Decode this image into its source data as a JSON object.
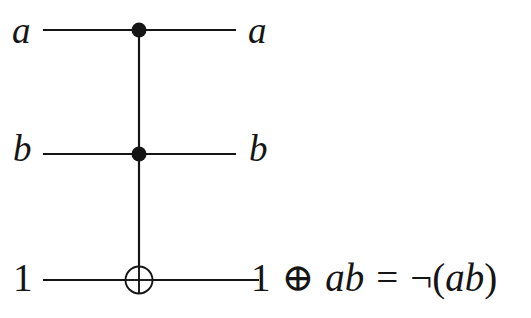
{
  "figure": {
    "type": "quantum-circuit-diagram",
    "background_color": "#ffffff",
    "line_color": "#151515"
  },
  "wires": [
    {
      "id": "wire-a",
      "input_label": "a",
      "output_label": "a",
      "y": 30,
      "x_start": 43,
      "x_end": 236,
      "element": "control-dot",
      "element_x": 139
    },
    {
      "id": "wire-b",
      "input_label": "b",
      "output_label": "b",
      "y": 154,
      "x_start": 43,
      "x_end": 236,
      "element": "control-dot",
      "element_x": 139
    },
    {
      "id": "wire-target",
      "input_label": "1",
      "output_label": "1 ⊕ ab = ¬(ab)",
      "y": 280,
      "x_start": 43,
      "x_end": 259,
      "element": "xor-target",
      "element_x": 139
    }
  ],
  "vertical_link": {
    "x": 139,
    "y_top": 30,
    "y_bottom": 280
  },
  "gates": {
    "control_dot_radius": 7,
    "target_circle_radius": 13.5,
    "stroke_width": 2.2
  },
  "output_expression": {
    "full": "1 ⊕ ab = ¬(ab)",
    "tokens": [
      {
        "text": "1",
        "style": "roman"
      },
      {
        "text": "⊕",
        "style": "operator"
      },
      {
        "text": "ab",
        "style": "italic"
      },
      {
        "text": "=",
        "style": "operator"
      },
      {
        "text": "¬",
        "style": "operator"
      },
      {
        "text": "(",
        "style": "roman"
      },
      {
        "text": "ab",
        "style": "italic"
      },
      {
        "text": ")",
        "style": "roman"
      }
    ]
  },
  "labels": {
    "in_a": "a",
    "in_b": "b",
    "in_one": "1",
    "out_a": "a",
    "out_b": "b",
    "out_one": "1",
    "oplus": "⊕",
    "ab_1": "ab",
    "equals": "=",
    "neg": "¬",
    "paren_open": "(",
    "ab_2": "ab",
    "paren_close": ")"
  }
}
